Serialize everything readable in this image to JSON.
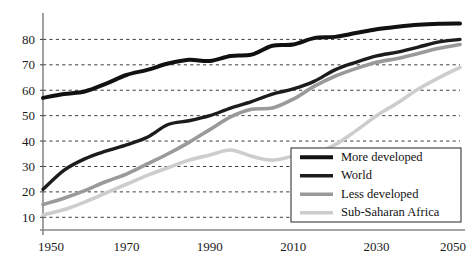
{
  "chart_data": {
    "type": "line",
    "title": "",
    "subtitle": "",
    "xlabel": "",
    "ylabel": "",
    "xlim": [
      1950,
      2050
    ],
    "ylim": [
      5,
      90
    ],
    "grid": true,
    "grid_style": "dashed-horizontal",
    "legend_position": "bottom-right",
    "x_ticks": [
      1950,
      1970,
      1990,
      2010,
      2030,
      2050
    ],
    "x_tick_labels": [
      "1950",
      "1970",
      "1990",
      "2010",
      "2030",
      "2050"
    ],
    "y_ticks": [
      10,
      20,
      30,
      40,
      50,
      60,
      70,
      80
    ],
    "y_tick_labels": [
      "10",
      "20",
      "30",
      "40",
      "50",
      "60",
      "70",
      "80"
    ],
    "x": [
      1950,
      1955,
      1960,
      1965,
      1970,
      1975,
      1980,
      1985,
      1990,
      1995,
      2000,
      2005,
      2010,
      2015,
      2020,
      2025,
      2030,
      2035,
      2040,
      2045,
      2050
    ],
    "series": [
      {
        "name": "More developed",
        "color": "#111111",
        "width": 4.0,
        "values": [
          57,
          58.5,
          59.5,
          62.5,
          66,
          68,
          70.5,
          72,
          71.5,
          73.5,
          74,
          77.5,
          78,
          80.5,
          81,
          82.5,
          84,
          85,
          85.8,
          86.2,
          86.3
        ]
      },
      {
        "name": "World",
        "color": "#1c1c1c",
        "width": 3.4,
        "values": [
          21,
          28.5,
          33,
          36,
          38.5,
          41.5,
          46.5,
          48,
          50,
          53,
          55.5,
          58.5,
          60.5,
          63.5,
          68,
          71,
          73.5,
          75,
          77,
          79,
          80
        ]
      },
      {
        "name": "Less developed",
        "color": "#9a9a9a",
        "width": 3.6,
        "values": [
          15,
          17.5,
          20.5,
          24,
          27,
          31,
          35,
          39.5,
          44.5,
          49.5,
          52.5,
          53,
          56.5,
          61.5,
          65.5,
          68.5,
          71,
          72.5,
          74.5,
          76.5,
          78
        ]
      },
      {
        "name": "Sub-Saharan Africa",
        "color": "#cdcdcd",
        "width": 3.6,
        "values": [
          11,
          13,
          16,
          19.5,
          23,
          26.5,
          29.5,
          32.5,
          34.5,
          36.5,
          34,
          32.5,
          34,
          35,
          38.5,
          44,
          50,
          55,
          60.5,
          65,
          69
        ]
      }
    ]
  },
  "legend": {
    "entries": [
      {
        "label": "More developed"
      },
      {
        "label": "World"
      },
      {
        "label": "Less developed"
      },
      {
        "label": "Sub-Saharan Africa"
      }
    ]
  }
}
